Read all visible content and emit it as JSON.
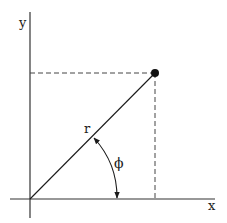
{
  "diagram": {
    "type": "polar-coordinates",
    "axes": {
      "x_label": "x",
      "y_label": "y"
    },
    "point": {
      "label": ""
    },
    "radius_label": "r",
    "angle_label": "ϕ",
    "colors": {
      "line": "#1a1a1a",
      "axis": "#333333",
      "dashed": "#444444",
      "background": "#ffffff"
    }
  }
}
